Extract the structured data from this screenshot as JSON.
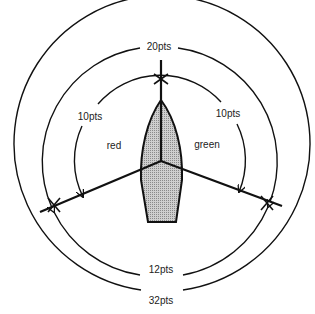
{
  "diagram": {
    "labels": {
      "top_arc": "20pts",
      "left_arc": "10pts",
      "right_arc": "10pts",
      "port_side": "red",
      "starboard_side": "green",
      "inner_bottom_arc": "12pts",
      "outer_bottom_arc": "32pts"
    },
    "colors": {
      "line": "#111111",
      "hull_fill": "#bdbdbd",
      "background": "#ffffff"
    }
  }
}
